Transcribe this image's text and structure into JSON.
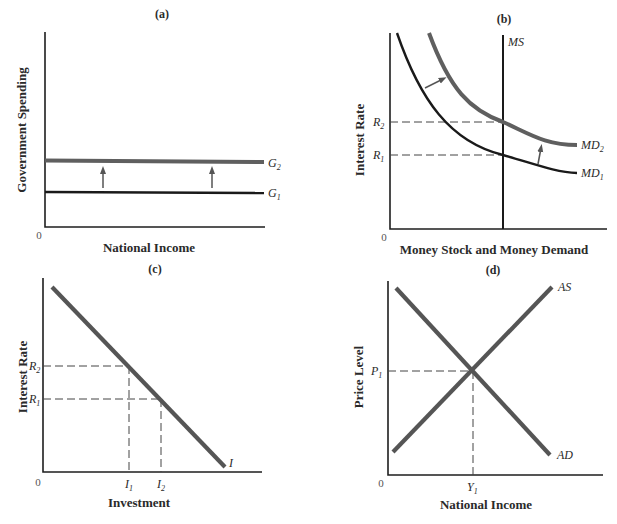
{
  "figure": {
    "panels": [
      {
        "id": "a",
        "title": "(a)",
        "ylabel": "Government Spending",
        "xlabel": "National Income",
        "origin": "0",
        "curves": [
          {
            "name": "G",
            "sub": "2",
            "style": "thick-gray",
            "type": "horizontal"
          },
          {
            "name": "G",
            "sub": "1",
            "style": "black",
            "type": "horizontal"
          }
        ],
        "annotation": "Upward arrows indicate shift from G1 to G2"
      },
      {
        "id": "b",
        "title": "(b)",
        "ylabel": "Interest Rate",
        "xlabel": "Money Stock and Money Demand",
        "origin": "0",
        "ticks_y": [
          {
            "name": "R",
            "sub": "2"
          },
          {
            "name": "R",
            "sub": "1"
          }
        ],
        "curves": [
          {
            "name": "MS",
            "sub": "",
            "style": "black",
            "type": "vertical"
          },
          {
            "name": "MD",
            "sub": "2",
            "style": "thick-gray",
            "type": "downward-convex"
          },
          {
            "name": "MD",
            "sub": "1",
            "style": "black",
            "type": "downward-convex"
          }
        ],
        "annotation": "Arrows indicate outward shift from MD1 to MD2"
      },
      {
        "id": "c",
        "title": "(c)",
        "ylabel": "Interest Rate",
        "xlabel": "Investment",
        "origin": "0",
        "ticks_y": [
          {
            "name": "R",
            "sub": "2"
          },
          {
            "name": "R",
            "sub": "1"
          }
        ],
        "ticks_x": [
          {
            "name": "I",
            "sub": "1"
          },
          {
            "name": "I",
            "sub": "2"
          }
        ],
        "curves": [
          {
            "name": "I",
            "sub": "",
            "style": "thick-gray",
            "type": "downward-linear"
          }
        ]
      },
      {
        "id": "d",
        "title": "(d)",
        "ylabel": "Price Level",
        "xlabel": "National Income",
        "origin": "0",
        "ticks_y": [
          {
            "name": "P",
            "sub": "1"
          }
        ],
        "ticks_x": [
          {
            "name": "Y",
            "sub": "1"
          }
        ],
        "curves": [
          {
            "name": "AS",
            "sub": "",
            "style": "thick-gray",
            "type": "upward-linear"
          },
          {
            "name": "AD",
            "sub": "",
            "style": "thick-gray",
            "type": "downward-linear"
          }
        ]
      }
    ]
  }
}
